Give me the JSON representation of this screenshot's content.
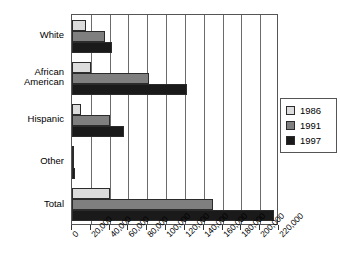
{
  "chart_data": {
    "type": "bar",
    "orientation": "horizontal",
    "title": "",
    "subtitle": "",
    "xlabel": "",
    "ylabel": "",
    "categories": [
      "White",
      "African American",
      "Hispanic",
      "Other",
      "Total"
    ],
    "series": [
      {
        "name": "1986",
        "color": "#dcdcdc",
        "values": [
          15000,
          20000,
          10000,
          500,
          40000
        ]
      },
      {
        "name": "1991",
        "color": "#7f7f7f",
        "values": [
          35000,
          82000,
          40000,
          1500,
          150000
        ]
      },
      {
        "name": "1997",
        "color": "#1a1a1a",
        "values": [
          42000,
          122000,
          55000,
          3500,
          215000
        ]
      }
    ],
    "xlim": [
      0,
      220000
    ],
    "xticks": [
      0,
      20000,
      40000,
      60000,
      80000,
      100000,
      120000,
      140000,
      160000,
      180000,
      200000,
      220000
    ],
    "xticklabels": [
      "0",
      "20,000",
      "40,000",
      "60,000",
      "80,000",
      "100,000",
      "120,000",
      "140,000",
      "160,000",
      "180,000",
      "200,000",
      "220,000"
    ],
    "grid": true,
    "grid_axis": "x",
    "legend_position": "right",
    "legend_entries": [
      "1986",
      "1991",
      "1997"
    ]
  },
  "category_labels": [
    {
      "line1": "White",
      "line2": ""
    },
    {
      "line1": "African",
      "line2": "American"
    },
    {
      "line1": "Hispanic",
      "line2": ""
    },
    {
      "line1": "Other",
      "line2": ""
    },
    {
      "line1": "Total",
      "line2": ""
    }
  ]
}
